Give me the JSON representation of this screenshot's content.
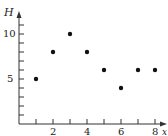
{
  "chart_data": {
    "type": "scatter",
    "title": "",
    "xlabel": "x",
    "ylabel": "H",
    "x": [
      1,
      2,
      3,
      4,
      5,
      6,
      7,
      8
    ],
    "y": [
      5,
      8,
      10,
      8,
      6,
      4,
      6,
      6
    ],
    "xlim": [
      0,
      8.5
    ],
    "ylim": [
      0,
      11.5
    ],
    "x_tick_labels": [
      "2",
      "4",
      "6",
      "8"
    ],
    "y_tick_labels": [
      "5",
      "10"
    ],
    "grid": false,
    "legend": null
  },
  "labels": {
    "ylabel": "H",
    "xlabel": "x",
    "xticks": [
      "2",
      "4",
      "6",
      "8"
    ],
    "yticks": [
      "5",
      "10"
    ]
  }
}
